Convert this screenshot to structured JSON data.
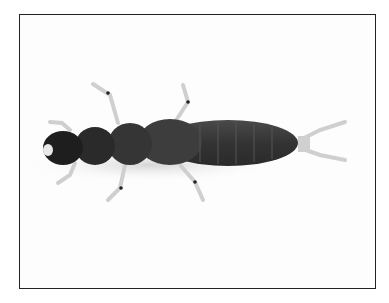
{
  "image": {
    "subject": "aquatic insect larva, dorsal view",
    "colors": {
      "frame": "#222222",
      "body": "#3a3a3a",
      "head": "#1e1e1e",
      "legs": "#d8d8d8",
      "background": "#fdfdfd"
    }
  }
}
